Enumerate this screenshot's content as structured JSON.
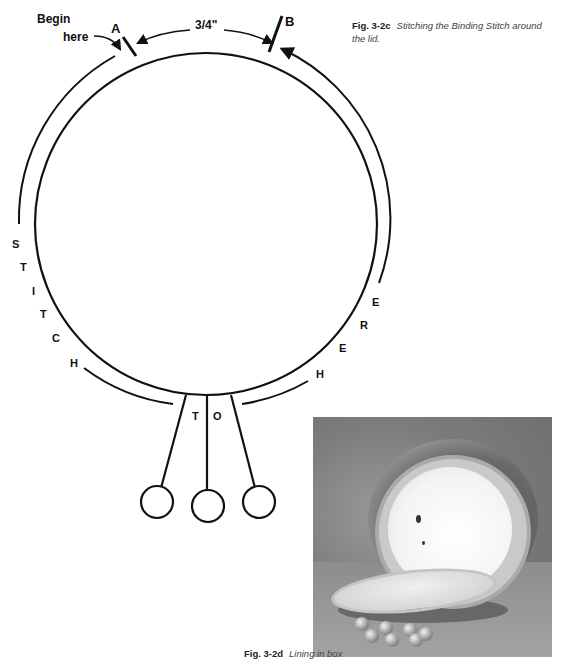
{
  "diagram": {
    "labels": {
      "begin_line1": "Begin",
      "begin_line2": "here",
      "point_a": "A",
      "point_b": "B",
      "distance": "3/4\"",
      "left_side_letters": [
        "S",
        "T",
        "I",
        "T",
        "C",
        "H"
      ],
      "bottom_letters": [
        "T",
        "O"
      ],
      "right_side_letters": [
        "E",
        "R",
        "E",
        "H"
      ]
    }
  },
  "captions": {
    "fig_c": {
      "number": "Fig. 3-2c",
      "text": "Stitching the Binding Stitch around the lid."
    },
    "fig_d": {
      "number": "Fig. 3-2d",
      "text": "Lining in box"
    }
  },
  "photo": {
    "description": "Photograph of crocheted round box with white lining and open lid, with beaded tassels"
  }
}
